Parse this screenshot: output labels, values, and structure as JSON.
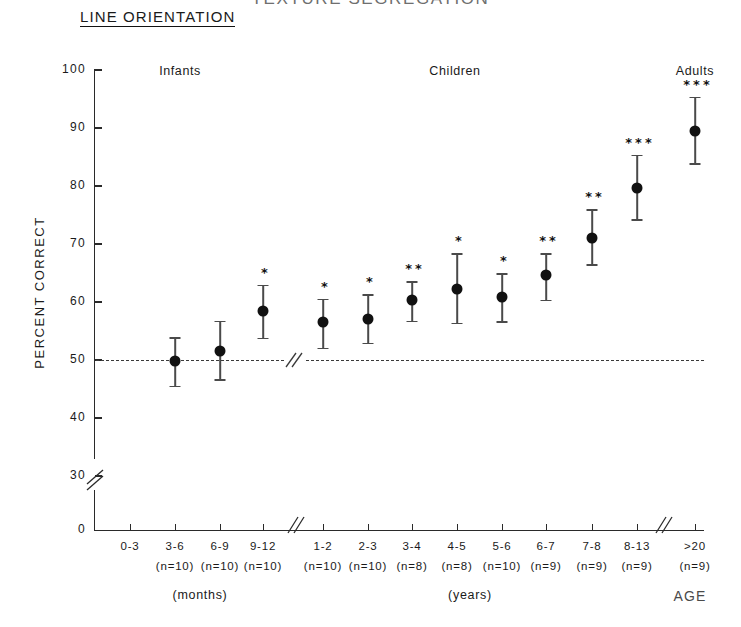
{
  "figure": {
    "supertitle": "TEXTURE SEGREGATION",
    "title": "LINE ORIENTATION",
    "age_axis_label": "AGE"
  },
  "groups": [
    {
      "name": "infants-label",
      "label": "Infants",
      "x": 180,
      "y": 64
    },
    {
      "name": "children-label",
      "label": "Children",
      "x": 455,
      "y": 64
    },
    {
      "name": "adults-label",
      "label": "Adults",
      "x": 695,
      "y": 64
    }
  ],
  "y_axis": {
    "label": "PERCENT CORRECT",
    "ticks": [
      100,
      90,
      80,
      70,
      60,
      50,
      40,
      30
    ],
    "zero_tick": 0,
    "has_break": true
  },
  "x_axis": {
    "months_unit": "(months)",
    "years_unit": "(years)",
    "has_break": true
  },
  "chart_data": {
    "type": "scatter",
    "title": "LINE ORIENTATION",
    "supertitle": "TEXTURE SEGREGATION",
    "xlabel": "AGE",
    "ylabel": "PERCENT CORRECT",
    "ylim": [
      30,
      100
    ],
    "y_ticks": [
      30,
      40,
      50,
      60,
      70,
      80,
      90,
      100
    ],
    "y_axis_break": "between 0 and 30",
    "x_axis_break": "between 9-12 months and 1-2 years",
    "grid": false,
    "legend": "none",
    "reference_line": {
      "y": 50,
      "style": "dashed",
      "meaning": "chance performance"
    },
    "error_bars": "mean with upper and lower error bars",
    "significance_key": "* p<.05, ** p<.01, *** p<.001 (asterisks above points)",
    "categories": [
      "0-3",
      "3-6",
      "6-9",
      "9-12",
      "1-2",
      "2-3",
      "3-4",
      "4-5",
      "5-6",
      "6-7",
      "7-8",
      "8-13",
      ">20"
    ],
    "units": [
      "months",
      "months",
      "months",
      "months",
      "years",
      "years",
      "years",
      "years",
      "years",
      "years",
      "years",
      "years",
      "years"
    ],
    "n_values": [
      null,
      10,
      10,
      10,
      10,
      10,
      8,
      8,
      10,
      9,
      9,
      9,
      9
    ],
    "n_labels": [
      "",
      "(n=10)",
      "(n=10)",
      "(n=10)",
      "(n=10)",
      "(n=10)",
      "(n=8)",
      "(n=8)",
      "(n=10)",
      "(n=9)",
      "(n=9)",
      "(n=9)",
      "(n=9)"
    ],
    "values": [
      null,
      49.9,
      51.6,
      58.4,
      56.6,
      57.0,
      60.4,
      62.2,
      60.8,
      64.6,
      71.1,
      79.7,
      89.5
    ],
    "err_upper": [
      null,
      4.0,
      5.2,
      4.6,
      4.0,
      4.3,
      3.2,
      6.2,
      4.2,
      3.8,
      4.9,
      5.7,
      5.9
    ],
    "err_lower": [
      null,
      4.3,
      4.9,
      4.6,
      4.5,
      4.0,
      3.6,
      5.8,
      4.1,
      4.2,
      4.6,
      5.4,
      5.6
    ],
    "significance": [
      "",
      "",
      "",
      "*",
      "*",
      "*",
      "**",
      "*",
      "*",
      "**",
      "**",
      "***",
      "***"
    ],
    "groups": {
      "Infants": [
        "0-3",
        "3-6",
        "6-9",
        "9-12"
      ],
      "Children": [
        "1-2",
        "2-3",
        "3-4",
        "4-5",
        "5-6",
        "6-7",
        "7-8",
        "8-13"
      ],
      "Adults": [
        ">20"
      ]
    }
  },
  "points": [
    {
      "cat": "0-3",
      "x": 130,
      "n": "",
      "value": null,
      "stars": ""
    },
    {
      "cat": "3-6",
      "x": 175,
      "n": "(n=10)",
      "value": 49.9,
      "stars": ""
    },
    {
      "cat": "6-9",
      "x": 220,
      "n": "(n=10)",
      "value": 51.6,
      "stars": ""
    },
    {
      "cat": "9-12",
      "x": 263,
      "n": "(n=10)",
      "value": 58.4,
      "stars": "*"
    },
    {
      "cat": "1-2",
      "x": 323,
      "n": "(n=10)",
      "value": 56.6,
      "stars": "*"
    },
    {
      "cat": "2-3",
      "x": 368,
      "n": "(n=10)",
      "value": 57.0,
      "stars": "*"
    },
    {
      "cat": "3-4",
      "x": 412,
      "n": "(n=8)",
      "value": 60.4,
      "stars": "**"
    },
    {
      "cat": "4-5",
      "x": 457,
      "n": "(n=8)",
      "value": 62.2,
      "stars": "*"
    },
    {
      "cat": "5-6",
      "x": 502,
      "n": "(n=10)",
      "value": 60.8,
      "stars": "*"
    },
    {
      "cat": "6-7",
      "x": 546,
      "n": "(n=9)",
      "value": 64.6,
      "stars": "**"
    },
    {
      "cat": "7-8",
      "x": 592,
      "n": "(n=9)",
      "value": 71.1,
      "stars": "**"
    },
    {
      "cat": "8-13",
      "x": 637,
      "n": "(n=9)",
      "value": 79.7,
      "stars": "***"
    },
    {
      "cat": ">20",
      "x": 695,
      "n": "(n=9)",
      "value": 89.5,
      "stars": "***"
    }
  ]
}
